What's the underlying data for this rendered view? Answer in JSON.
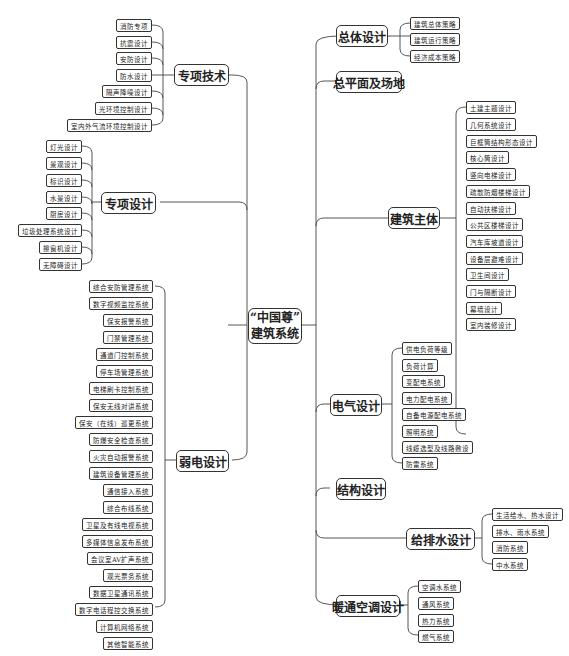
{
  "root": {
    "line1": "“中国尊”",
    "line2": "建筑系统"
  },
  "left_branches": {
    "zhuanxiang_jishu": {
      "label": "专项技术",
      "children": [
        "消防专项",
        "抗震设计",
        "安防设计",
        "防水设计",
        "隔声降噪设计",
        "光环境控制设计",
        "室内外气流环境控制设计"
      ]
    },
    "zhuanxiang_sheji": {
      "label": "专项设计",
      "children": [
        "灯光设计",
        "景观设计",
        "标识设计",
        "水景设计",
        "厨房设计",
        "垃圾处理系统设计",
        "擦窗机设计",
        "无障碍设计"
      ]
    },
    "ruodian_sheji": {
      "label": "弱电设计",
      "children": [
        "综合安防管理系统",
        "数字视频监控系统",
        "保安报警系统",
        "门禁管理系统",
        "通道门控制系统",
        "停车场管理系统",
        "电梯刷卡控制系统",
        "保安无线对讲系统",
        "保安（在线）巡更系统",
        "防爆安全检查系统",
        "火灾自动报警系统",
        "建筑设备管理系统",
        "通信接入系统",
        "综合布线系统",
        "卫星及有线电视系统",
        "多媒体信息发布系统",
        "会议室AV扩声系统",
        "观光票务系统",
        "数据卫星通讯系统",
        "数字电话程控交换系统",
        "计算机网络系统",
        "其他智能系统"
      ]
    }
  },
  "right_branches": {
    "zongti_sheji": {
      "label": "总体设计",
      "children": [
        "建筑总体策略",
        "建筑运行策略",
        "经济成本策略"
      ]
    },
    "zongpingmian": {
      "label": "总平面及场地",
      "children": []
    },
    "jianzhu_zhuti": {
      "label": "建筑主体",
      "children": [
        "土建主题设计",
        "几何系统设计",
        "巨框筒结构形态设计",
        "核心筒设计",
        "竖向电梯设计",
        "疏散防烟楼梯设计",
        "自动扶梯设计",
        "公共区楼梯设计",
        "汽车库坡道设计",
        "设备层避难设计",
        "卫生间设计",
        "门与隔断设计",
        "幕墙设计",
        "室内装修设计"
      ]
    },
    "dianqi_sheji": {
      "label": "电气设计",
      "children": [
        "供电负荷等级",
        "负荷计算",
        "变配电系统",
        "电力配电系统",
        "自备电源配电系统",
        "照明系统",
        "线缆选型及线路敷设",
        "防雷系统"
      ]
    },
    "jiegou_sheji": {
      "label": "结构设计",
      "children": []
    },
    "jipaishui_sheji": {
      "label": "给排水设计",
      "children": [
        "生活给水、热水设计",
        "排水、雨水系统",
        "消防系统",
        "中水系统"
      ]
    },
    "nuantong_sheji": {
      "label": "暖通空调设计",
      "children": [
        "空调水系统",
        "通风系统",
        "热力系统",
        "燃气系统"
      ]
    }
  }
}
